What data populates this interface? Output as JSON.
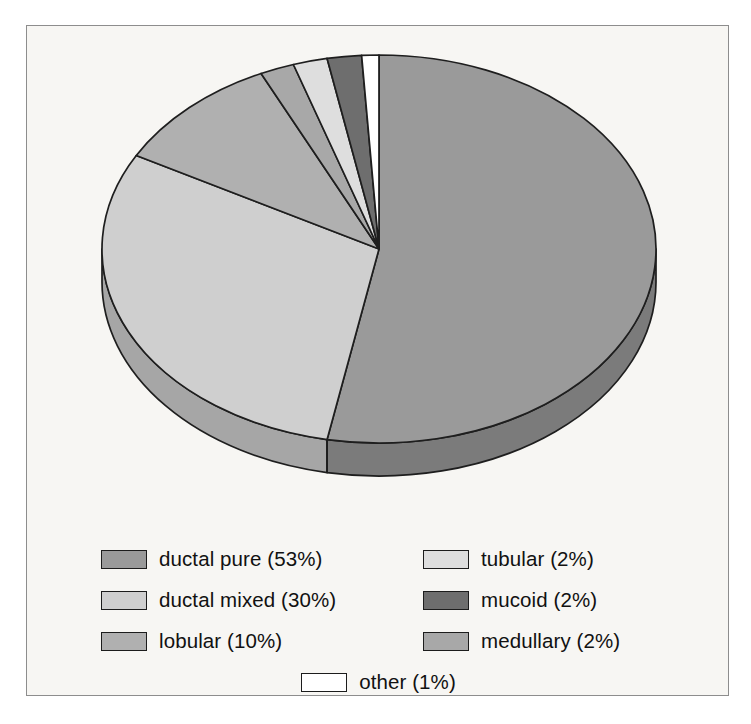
{
  "figure": {
    "background_color": "#f7f6f3",
    "frame_color": "#8d8d8d",
    "page_color": "#ffffff"
  },
  "chart_data": {
    "type": "pie",
    "title": "",
    "subtitle": "",
    "xlabel": "",
    "ylabel": "",
    "grid": false,
    "legend_position": "bottom",
    "three_d": true,
    "start_angle_deg": 0,
    "direction": "clockwise",
    "units": "percent",
    "total": 100,
    "labels": [
      "ductal pure",
      "ductal mixed",
      "lobular",
      "medullary",
      "tubular",
      "mucoid",
      "other"
    ],
    "values": [
      53,
      30,
      10,
      2,
      2,
      2,
      1
    ],
    "colors": [
      "#9a9a9a",
      "#cfcfcf",
      "#b0b0b0",
      "#a8a8a8",
      "#dedede",
      "#6e6e6e",
      "#ffffff"
    ],
    "side_colors": [
      "#7b7b7b",
      "#a6a6a6",
      "#8d8d8d",
      "#878787",
      "#b4b4b4",
      "#585858",
      "#d2d2d2"
    ],
    "slices": [
      {
        "label": "ductal pure",
        "value": 53,
        "display": "ductal pure (53%)",
        "color": "#9a9a9a"
      },
      {
        "label": "ductal mixed",
        "value": 30,
        "display": "ductal mixed (30%)",
        "color": "#cfcfcf"
      },
      {
        "label": "lobular",
        "value": 10,
        "display": "lobular (10%)",
        "color": "#b0b0b0"
      },
      {
        "label": "medullary",
        "value": 2,
        "display": "medullary (2%)",
        "color": "#a8a8a8"
      },
      {
        "label": "tubular",
        "value": 2,
        "display": "tubular (2%)",
        "color": "#dedede"
      },
      {
        "label": "mucoid",
        "value": 2,
        "display": "mucoid (2%)",
        "color": "#6e6e6e"
      },
      {
        "label": "other",
        "value": 1,
        "display": "other (1%)",
        "color": "#ffffff"
      }
    ]
  },
  "legend": {
    "left_column": [
      {
        "text": "ductal pure (53%)",
        "color": "#9a9a9a"
      },
      {
        "text": "ductal mixed (30%)",
        "color": "#cfcfcf"
      },
      {
        "text": "lobular (10%)",
        "color": "#b0b0b0"
      }
    ],
    "right_column": [
      {
        "text": "tubular (2%)",
        "color": "#dedede"
      },
      {
        "text": "mucoid (2%)",
        "color": "#6e6e6e"
      },
      {
        "text": "medullary (2%)",
        "color": "#a8a8a8"
      }
    ],
    "bottom_row": [
      {
        "text": "other (1%)",
        "color": "#ffffff"
      }
    ]
  }
}
